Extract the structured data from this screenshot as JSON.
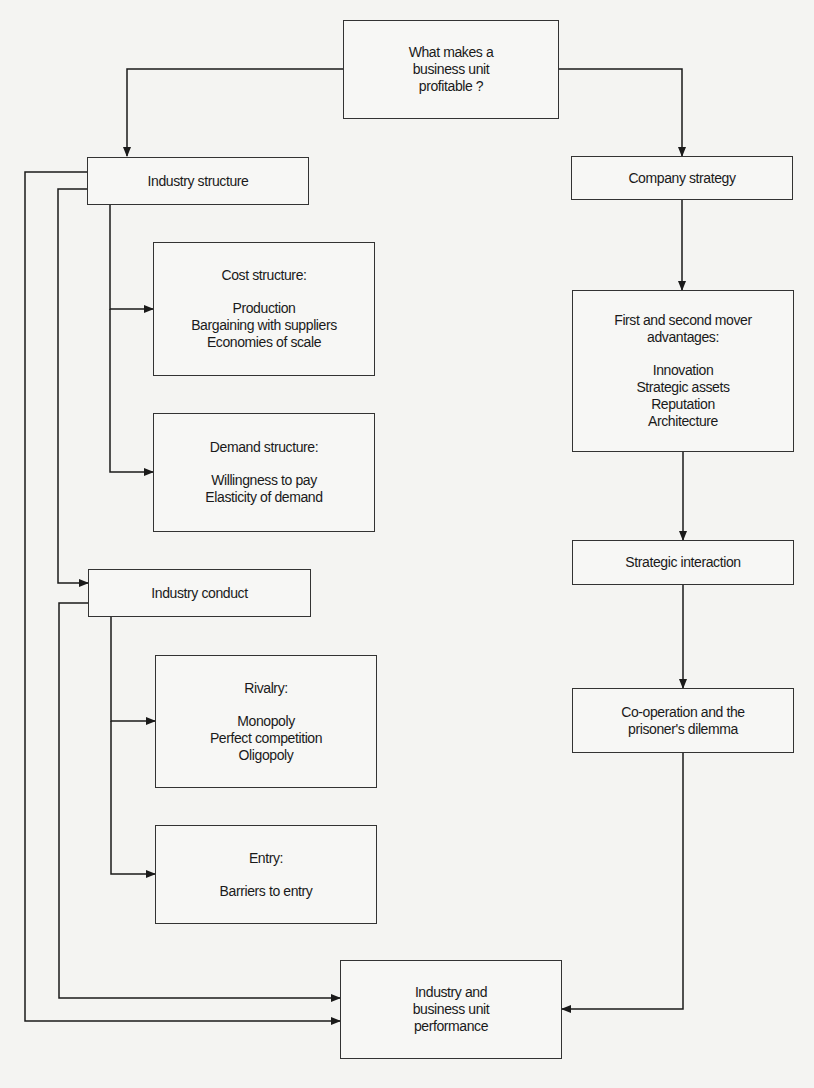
{
  "diagram": {
    "root": {
      "lines": [
        "What makes a",
        "business unit",
        "profitable ?"
      ]
    },
    "industry_structure": {
      "title": "Industry structure"
    },
    "cost_structure": {
      "title": "Cost structure:",
      "items": [
        "Production",
        "Bargaining with suppliers",
        "Economies of scale"
      ]
    },
    "demand_structure": {
      "title": "Demand structure:",
      "items": [
        "Willingness to pay",
        "Elasticity of demand"
      ]
    },
    "industry_conduct": {
      "title": "Industry conduct"
    },
    "rivalry": {
      "title": "Rivalry:",
      "items": [
        "Monopoly",
        "Perfect competition",
        "Oligopoly"
      ]
    },
    "entry": {
      "title": "Entry:",
      "items": [
        "Barriers to entry"
      ]
    },
    "company_strategy": {
      "title": "Company strategy"
    },
    "mover_advantages": {
      "title_lines": [
        "First and second mover",
        "advantages:"
      ],
      "items": [
        "Innovation",
        "Strategic assets",
        "Reputation",
        "Architecture"
      ]
    },
    "strategic_interaction": {
      "title": "Strategic interaction"
    },
    "cooperation": {
      "lines": [
        "Co-operation and the",
        "prisoner's dilemma"
      ]
    },
    "performance": {
      "lines": [
        "Industry and",
        "business unit",
        "performance"
      ]
    }
  },
  "colors": {
    "line": "#1a1a1a",
    "box_border": "#333333",
    "background": "#f4f4f2"
  }
}
